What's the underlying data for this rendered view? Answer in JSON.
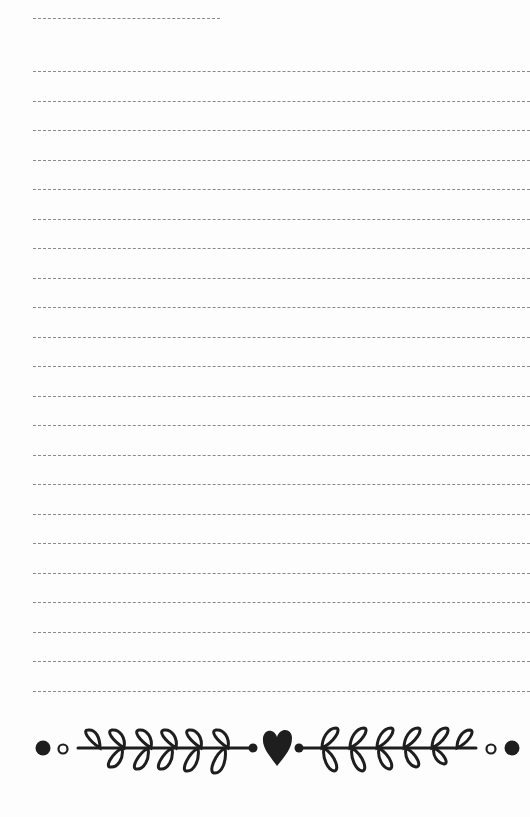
{
  "page": {
    "type": "lined-notepaper",
    "background": "#fdfdfd",
    "line_color": "#8a8a8a",
    "ink_color": "#1e1e1e"
  },
  "title_line": {
    "y": 18,
    "x_start": 33,
    "x_end": 220
  },
  "writing_lines": {
    "count": 22,
    "first_y": 71,
    "spacing": 29.5,
    "x_start": 33,
    "x_end": 530
  },
  "ornament": {
    "description": "laurel branches with central heart",
    "icons": [
      "dot-icon",
      "ring-icon",
      "laurel-branch-left-icon",
      "heart-icon",
      "laurel-branch-right-icon",
      "ring-icon",
      "dot-icon"
    ]
  }
}
